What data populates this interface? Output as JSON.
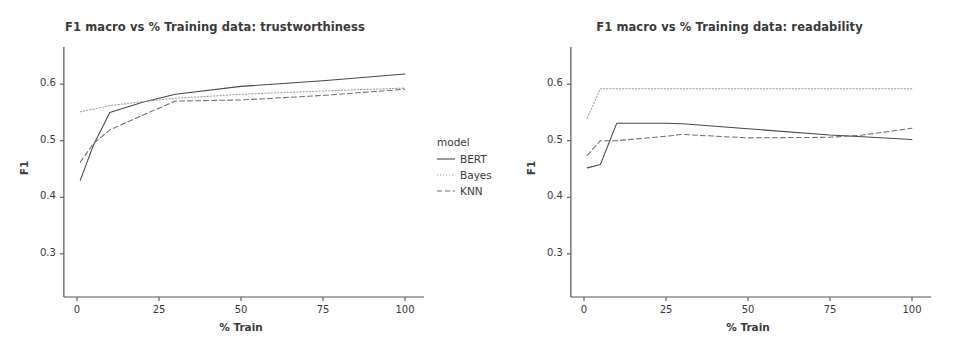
{
  "figure": {
    "width": 954,
    "height": 349,
    "background": "#ffffff",
    "line_color": "#4a4a4a",
    "axis_color": "#555555",
    "text_color": "#3a3a3a"
  },
  "legend": {
    "title": "model",
    "entries": [
      {
        "label": "BERT",
        "style": "solid"
      },
      {
        "label": "Bayes",
        "style": "dotted"
      },
      {
        "label": "KNN",
        "style": "dashed"
      }
    ]
  },
  "chart_data": [
    {
      "id": "trustworthiness",
      "type": "line",
      "title": "F1 macro vs % Training data: trustworthiness",
      "xlabel": "% Train",
      "ylabel": "F1",
      "xlim": [
        -4,
        104
      ],
      "ylim": [
        0.245,
        0.655
      ],
      "xticks": [
        0,
        25,
        50,
        75,
        100
      ],
      "xticklabels": [
        "0",
        "25",
        "50",
        "75",
        "100"
      ],
      "yticks": [
        0.3,
        0.4,
        0.5,
        0.6
      ],
      "yticklabels": [
        "0.3",
        "0.4",
        "0.5",
        "0.6"
      ],
      "grid": false,
      "legend_position": "right-outside",
      "x": [
        1,
        5,
        10,
        20,
        30,
        50,
        75,
        100
      ],
      "series": [
        {
          "name": "BERT",
          "style": "solid",
          "values": [
            0.43,
            0.492,
            0.55,
            0.568,
            0.582,
            0.596,
            0.606,
            0.618
          ]
        },
        {
          "name": "Bayes",
          "style": "dotted",
          "values": [
            0.551,
            0.556,
            0.562,
            0.569,
            0.575,
            0.582,
            0.588,
            0.593
          ]
        },
        {
          "name": "KNN",
          "style": "dashed",
          "values": [
            0.462,
            0.495,
            0.519,
            0.545,
            0.57,
            0.572,
            0.58,
            0.591
          ]
        }
      ]
    },
    {
      "id": "readability",
      "type": "line",
      "title": "F1 macro vs % Training data: readability",
      "xlabel": "% Train",
      "ylabel": "F1",
      "xlim": [
        -4,
        104
      ],
      "ylim": [
        0.245,
        0.655
      ],
      "xticks": [
        0,
        25,
        50,
        75,
        100
      ],
      "xticklabels": [
        "0",
        "25",
        "50",
        "75",
        "100"
      ],
      "yticks": [
        0.3,
        0.4,
        0.5,
        0.6
      ],
      "yticklabels": [
        "0.3",
        "0.4",
        "0.5",
        "0.6"
      ],
      "grid": false,
      "legend_position": "shared-left",
      "x": [
        1,
        5,
        10,
        25,
        30,
        50,
        75,
        85,
        100
      ],
      "series": [
        {
          "name": "BERT",
          "style": "solid",
          "values": [
            0.452,
            0.458,
            0.531,
            0.531,
            0.53,
            0.521,
            0.51,
            0.507,
            0.502
          ]
        },
        {
          "name": "Bayes",
          "style": "dotted",
          "values": [
            0.54,
            0.592,
            0.592,
            0.592,
            0.592,
            0.592,
            0.592,
            0.592,
            0.592
          ]
        },
        {
          "name": "KNN",
          "style": "dashed",
          "values": [
            0.474,
            0.5,
            0.5,
            0.508,
            0.511,
            0.505,
            0.506,
            0.51,
            0.522
          ]
        }
      ]
    }
  ]
}
